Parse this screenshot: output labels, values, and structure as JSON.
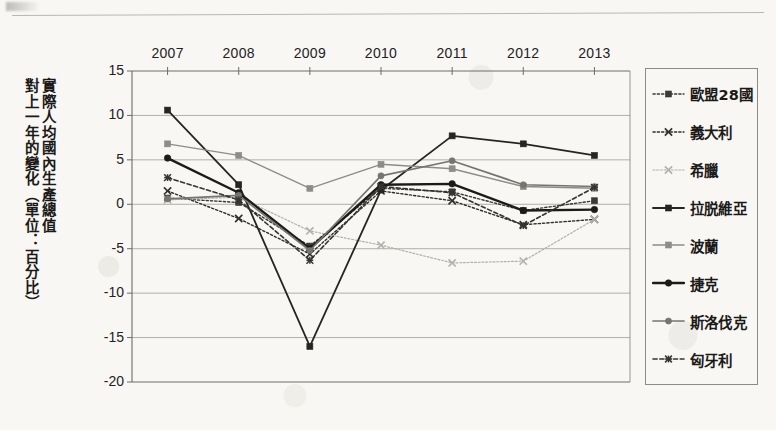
{
  "page": {
    "background_color": "#f8f7f3",
    "rule_color": "#b9b7b2"
  },
  "axis_title": {
    "column_right": "實際人均國內生產總值",
    "column_left": "對上一年的變化（單位：百分比）"
  },
  "chart_data": {
    "type": "line",
    "title": "",
    "subtitle": "",
    "xlabel": "",
    "ylabel": "實際人均國內生產總值對上一年的變化（單位：百分比）",
    "categories": [
      "2007",
      "2008",
      "2009",
      "2010",
      "2011",
      "2012",
      "2013"
    ],
    "x_tick_labels": [
      "2007",
      "2008",
      "2009",
      "2010",
      "2011",
      "2012",
      "2013"
    ],
    "y_tick_labels": [
      "15",
      "10",
      "5",
      "0",
      "-5",
      "-10",
      "-15",
      "-20"
    ],
    "y_ticks": [
      15,
      10,
      5,
      0,
      -5,
      -10,
      -15,
      -20
    ],
    "ylim": [
      -20,
      15
    ],
    "grid": "horizontal",
    "legend_position": "right",
    "xaxis_labels_position": "top",
    "series": [
      {
        "name": "歐盟28國",
        "color": "#3b3a38",
        "marker": "square",
        "dash": "dotted",
        "width": 1.4,
        "values": [
          0.7,
          0.2,
          -4.7,
          1.8,
          1.4,
          -0.7,
          0.4
        ]
      },
      {
        "name": "義大利",
        "color": "#2f2e2c",
        "marker": "cross",
        "dash": "dotted",
        "width": 1.4,
        "values": [
          1.5,
          -1.6,
          -5.6,
          1.5,
          0.4,
          -2.3,
          -1.7
        ]
      },
      {
        "name": "希臘",
        "color": "#b2b0ab",
        "marker": "cross",
        "dash": "dotted",
        "width": 1.2,
        "values": [
          0.5,
          0.8,
          -3.0,
          -4.6,
          -6.6,
          -6.4,
          -1.7
        ]
      },
      {
        "name": "拉脱維亞",
        "color": "#262523",
        "marker": "square",
        "dash": "solid",
        "width": 1.8,
        "values": [
          10.6,
          2.2,
          -16.0,
          1.6,
          7.7,
          6.8,
          5.5
        ]
      },
      {
        "name": "波蘭",
        "color": "#8e8c88",
        "marker": "square",
        "dash": "solid",
        "width": 1.4,
        "values": [
          6.8,
          5.5,
          1.8,
          4.5,
          4.0,
          2.0,
          1.8
        ]
      },
      {
        "name": "捷克",
        "color": "#1c1b1a",
        "marker": "circle",
        "dash": "solid",
        "width": 2.4,
        "values": [
          5.2,
          1.3,
          -5.0,
          2.2,
          2.3,
          -0.7,
          -0.6
        ]
      },
      {
        "name": "斯洛伐克",
        "color": "#777570",
        "marker": "circle",
        "dash": "solid",
        "width": 1.7,
        "values": [
          0.6,
          1.0,
          -5.2,
          3.2,
          4.9,
          2.2,
          2.0
        ]
      },
      {
        "name": "匈牙利",
        "color": "#363532",
        "marker": "star",
        "dash": "dashed",
        "width": 1.6,
        "values": [
          3.0,
          0.5,
          -6.3,
          2.0,
          1.3,
          -2.4,
          1.9
        ]
      }
    ]
  },
  "legend": {
    "items": [
      {
        "label": "歐盟28國"
      },
      {
        "label": "義大利"
      },
      {
        "label": "希臘"
      },
      {
        "label": "拉脱維亞"
      },
      {
        "label": "波蘭"
      },
      {
        "label": "捷克"
      },
      {
        "label": "斯洛伐克"
      },
      {
        "label": "匈牙利"
      }
    ]
  }
}
